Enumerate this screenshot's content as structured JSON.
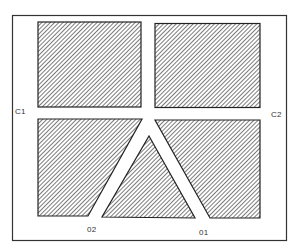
{
  "diagram": {
    "type": "site-plan",
    "colors": {
      "background": "#ffffff",
      "frame": "#333333",
      "hatch": "#444444",
      "outline": "#222222"
    },
    "labels": {
      "c1": "C1",
      "c2": "C2",
      "o1": "01",
      "o2": "02"
    },
    "regions": [
      {
        "id": "top-left-block",
        "shape": "rectangle",
        "hatched": true
      },
      {
        "id": "top-right-block",
        "shape": "rectangle",
        "hatched": true
      },
      {
        "id": "bottom-left-block",
        "shape": "trapezoid",
        "hatched": true
      },
      {
        "id": "bottom-center-triangle",
        "shape": "triangle",
        "hatched": true
      },
      {
        "id": "bottom-right-block",
        "shape": "trapezoid",
        "hatched": true
      }
    ],
    "openings": [
      {
        "id": "C1",
        "position": "left side, between left blocks"
      },
      {
        "id": "C2",
        "position": "right side, between right blocks"
      },
      {
        "id": "02",
        "position": "bottom, left fork of corridor"
      },
      {
        "id": "01",
        "position": "bottom, right fork of corridor"
      }
    ]
  }
}
